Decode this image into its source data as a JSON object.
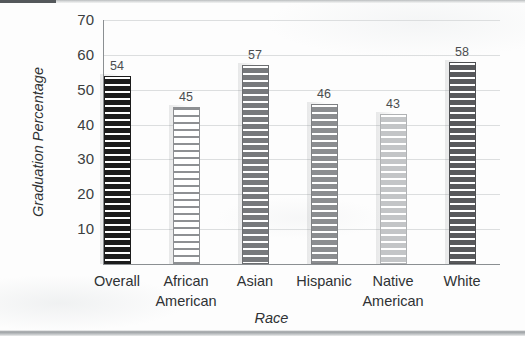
{
  "chart_data": {
    "type": "bar",
    "title": "",
    "xlabel": "Race",
    "ylabel": "Graduation Percentage",
    "categories": [
      "Overall",
      "African American",
      "Asian",
      "Hispanic",
      "Native American",
      "White"
    ],
    "category_lines": [
      [
        "Overall",
        ""
      ],
      [
        "African",
        "American"
      ],
      [
        "Asian",
        ""
      ],
      [
        "Hispanic",
        ""
      ],
      [
        "Native",
        "American"
      ],
      [
        "White",
        ""
      ]
    ],
    "values": [
      54,
      45,
      57,
      46,
      43,
      58
    ],
    "value_labels": [
      "54",
      "45",
      "57",
      "46",
      "43",
      "58"
    ],
    "ylim": [
      0,
      70
    ],
    "yticks": [
      70,
      60,
      50,
      40,
      30,
      20,
      10
    ],
    "ytick_labels": [
      "70",
      "60",
      "50",
      "40",
      "30",
      "20",
      "10"
    ],
    "grid": true,
    "legend": "none",
    "bar_fills": [
      "#1c1c1c",
      "#ffffff",
      "#77797c",
      "#8b8d90",
      "#c3c5c7",
      "#58595c"
    ],
    "bar_stripes": [
      "#ffffff",
      "#8e9093",
      "#ffffff",
      "#ffffff",
      "#ffffff",
      "#ffffff"
    ],
    "bar_borders": [
      "#1c1c1c",
      "#8e9093",
      "#6b6d70",
      "#7e8083",
      "#b0b2b4",
      "#4d4e51"
    ],
    "axis_color": "#8b8f92",
    "grid_color": "#dcdedf",
    "text_color": "#2f3234"
  }
}
